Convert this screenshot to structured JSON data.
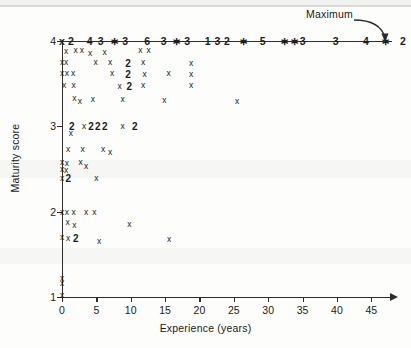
{
  "chart_data": {
    "type": "scatter",
    "title": "",
    "xlabel": "Experience (years)",
    "ylabel": "Maturity score",
    "xlim": [
      0,
      47
    ],
    "ylim": [
      1,
      4
    ],
    "xticks": [
      0,
      5,
      10,
      15,
      20,
      25,
      30,
      35,
      40,
      45
    ],
    "yticks": [
      1,
      2,
      3,
      4
    ],
    "grid": false,
    "legend": null,
    "annotations": [
      {
        "text": "Maximum",
        "target": "top row of points at maturity score 4"
      }
    ],
    "top_row_sequence": [
      "2",
      "-",
      "4",
      "3",
      "*",
      "3",
      "-",
      "6",
      "-",
      "3",
      "*",
      "3",
      "-",
      "1",
      "3",
      "2",
      "-",
      "*",
      "-",
      "5",
      "-",
      "*",
      "*",
      "3",
      "-",
      "3",
      "-",
      "4",
      "-",
      "*",
      "-",
      "2",
      "-",
      "*"
    ],
    "points": [
      {
        "x": 0.0,
        "y": 4.0,
        "label": "x"
      },
      {
        "x": 1.3,
        "y": 4.0,
        "label": "2"
      },
      {
        "x": 4.0,
        "y": 4.0,
        "label": "4"
      },
      {
        "x": 5.6,
        "y": 4.0,
        "label": "3"
      },
      {
        "x": 7.6,
        "y": 4.0,
        "label": "*"
      },
      {
        "x": 9.2,
        "y": 4.0,
        "label": "3"
      },
      {
        "x": 12.4,
        "y": 4.0,
        "label": "6"
      },
      {
        "x": 14.8,
        "y": 4.0,
        "label": "3"
      },
      {
        "x": 16.6,
        "y": 4.0,
        "label": "*"
      },
      {
        "x": 18.2,
        "y": 4.0,
        "label": "3"
      },
      {
        "x": 21.2,
        "y": 4.0,
        "label": "1"
      },
      {
        "x": 22.6,
        "y": 4.0,
        "label": "3"
      },
      {
        "x": 24.0,
        "y": 4.0,
        "label": "2"
      },
      {
        "x": 26.4,
        "y": 4.0,
        "label": "*"
      },
      {
        "x": 29.2,
        "y": 4.0,
        "label": "5"
      },
      {
        "x": 32.4,
        "y": 4.0,
        "label": "*"
      },
      {
        "x": 33.8,
        "y": 4.0,
        "label": "*"
      },
      {
        "x": 35.0,
        "y": 4.0,
        "label": "3"
      },
      {
        "x": 39.8,
        "y": 4.0,
        "label": "3"
      },
      {
        "x": 44.2,
        "y": 4.0,
        "label": "4"
      },
      {
        "x": 47.0,
        "y": 4.0,
        "label": "*"
      },
      {
        "x": 49.6,
        "y": 4.0,
        "label": "2"
      },
      {
        "x": 52.4,
        "y": 4.0,
        "label": "*"
      },
      {
        "x": 0.6,
        "y": 3.88,
        "label": "x"
      },
      {
        "x": 2.0,
        "y": 3.9,
        "label": "x"
      },
      {
        "x": 2.9,
        "y": 3.9,
        "label": "x"
      },
      {
        "x": 4.1,
        "y": 3.86,
        "label": "x"
      },
      {
        "x": 6.2,
        "y": 3.87,
        "label": "x"
      },
      {
        "x": 11.4,
        "y": 3.89,
        "label": "x"
      },
      {
        "x": 12.6,
        "y": 3.89,
        "label": "x"
      },
      {
        "x": 0.0,
        "y": 3.76,
        "label": "x"
      },
      {
        "x": 0.6,
        "y": 3.76,
        "label": "x"
      },
      {
        "x": 4.9,
        "y": 3.75,
        "label": "x"
      },
      {
        "x": 7.0,
        "y": 3.75,
        "label": "x"
      },
      {
        "x": 9.6,
        "y": 3.74,
        "label": "2"
      },
      {
        "x": 11.8,
        "y": 3.75,
        "label": "x"
      },
      {
        "x": 18.8,
        "y": 3.74,
        "label": "x"
      },
      {
        "x": 0.0,
        "y": 3.63,
        "label": "x"
      },
      {
        "x": 0.7,
        "y": 3.62,
        "label": "x"
      },
      {
        "x": 1.6,
        "y": 3.63,
        "label": "x"
      },
      {
        "x": 7.3,
        "y": 3.62,
        "label": "x"
      },
      {
        "x": 9.6,
        "y": 3.61,
        "label": "2"
      },
      {
        "x": 12.0,
        "y": 3.61,
        "label": "x"
      },
      {
        "x": 15.5,
        "y": 3.62,
        "label": "x"
      },
      {
        "x": 18.8,
        "y": 3.61,
        "label": "x"
      },
      {
        "x": 0.3,
        "y": 3.48,
        "label": "x"
      },
      {
        "x": 1.7,
        "y": 3.49,
        "label": "x"
      },
      {
        "x": 8.4,
        "y": 3.47,
        "label": "x"
      },
      {
        "x": 9.8,
        "y": 3.47,
        "label": "2"
      },
      {
        "x": 11.8,
        "y": 3.49,
        "label": "x"
      },
      {
        "x": 18.8,
        "y": 3.48,
        "label": "x"
      },
      {
        "x": 1.8,
        "y": 3.33,
        "label": "x"
      },
      {
        "x": 2.6,
        "y": 3.3,
        "label": "x"
      },
      {
        "x": 4.5,
        "y": 3.32,
        "label": "x"
      },
      {
        "x": 8.8,
        "y": 3.32,
        "label": "x"
      },
      {
        "x": 14.9,
        "y": 3.31,
        "label": "x"
      },
      {
        "x": 25.5,
        "y": 3.3,
        "label": "x"
      },
      {
        "x": 1.4,
        "y": 3.0,
        "label": "2"
      },
      {
        "x": 3.2,
        "y": 3.0,
        "label": "x"
      },
      {
        "x": 4.2,
        "y": 3.0,
        "label": "2"
      },
      {
        "x": 5.2,
        "y": 3.0,
        "label": "2"
      },
      {
        "x": 6.2,
        "y": 3.0,
        "label": "2"
      },
      {
        "x": 8.8,
        "y": 3.0,
        "label": "x"
      },
      {
        "x": 10.6,
        "y": 3.0,
        "label": "2"
      },
      {
        "x": 1.3,
        "y": 2.92,
        "label": "x"
      },
      {
        "x": 0.9,
        "y": 2.74,
        "label": "x"
      },
      {
        "x": 3.0,
        "y": 2.73,
        "label": "x"
      },
      {
        "x": 6.0,
        "y": 2.74,
        "label": "x"
      },
      {
        "x": 7.0,
        "y": 2.7,
        "label": "x"
      },
      {
        "x": 0.0,
        "y": 2.58,
        "label": "x"
      },
      {
        "x": 0.7,
        "y": 2.57,
        "label": "x"
      },
      {
        "x": 2.7,
        "y": 2.58,
        "label": "x"
      },
      {
        "x": 3.5,
        "y": 2.54,
        "label": "x"
      },
      {
        "x": 0.0,
        "y": 2.5,
        "label": "x"
      },
      {
        "x": 0.6,
        "y": 2.49,
        "label": "x"
      },
      {
        "x": 0.0,
        "y": 2.4,
        "label": "x"
      },
      {
        "x": 0.9,
        "y": 2.4,
        "label": "2"
      },
      {
        "x": 5.0,
        "y": 2.39,
        "label": "x"
      },
      {
        "x": 0.0,
        "y": 2.0,
        "label": "x"
      },
      {
        "x": 0.7,
        "y": 2.0,
        "label": "x"
      },
      {
        "x": 1.7,
        "y": 2.0,
        "label": "x"
      },
      {
        "x": 3.5,
        "y": 2.0,
        "label": "x"
      },
      {
        "x": 4.7,
        "y": 2.0,
        "label": "x"
      },
      {
        "x": 0.8,
        "y": 1.88,
        "label": "x"
      },
      {
        "x": 1.8,
        "y": 1.84,
        "label": "x"
      },
      {
        "x": 9.8,
        "y": 1.86,
        "label": "x"
      },
      {
        "x": 0.0,
        "y": 1.7,
        "label": "x"
      },
      {
        "x": 0.9,
        "y": 1.69,
        "label": "x"
      },
      {
        "x": 2.0,
        "y": 1.69,
        "label": "2"
      },
      {
        "x": 5.4,
        "y": 1.66,
        "label": "x"
      },
      {
        "x": 15.6,
        "y": 1.68,
        "label": "x"
      },
      {
        "x": 0.0,
        "y": 1.22,
        "label": "x"
      },
      {
        "x": 0.0,
        "y": 1.16,
        "label": "x"
      },
      {
        "x": 0.0,
        "y": 1.02,
        "label": "x"
      }
    ]
  },
  "annotation": {
    "maximum_label": "Maximum"
  }
}
